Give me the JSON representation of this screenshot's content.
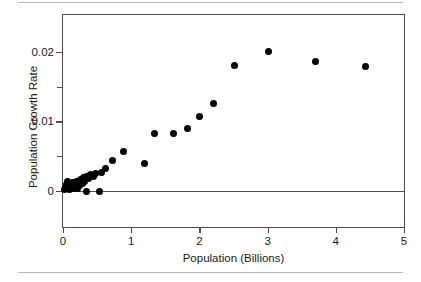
{
  "figure": {
    "rules": [
      "top-divider",
      "bottom-divider"
    ]
  },
  "chart_data": {
    "type": "scatter",
    "title": "",
    "xlabel": "Population (Billions)",
    "ylabel": "Population Growth Rate",
    "xlim": [
      0,
      5
    ],
    "ylim": [
      -0.0052,
      0.0253
    ],
    "grid": false,
    "legend": null,
    "xticks": [
      0,
      1,
      2,
      3,
      4,
      5
    ],
    "xticklabels": [
      "0",
      "1",
      "2",
      "3",
      "4",
      "5"
    ],
    "yticks": [
      0,
      0.005,
      0.01,
      0.015,
      0.02
    ],
    "yticklabels": [
      "0",
      "",
      "0.01",
      "",
      "0.02"
    ],
    "ytick_major": [
      0,
      0.01,
      0.02
    ],
    "ytick_minor": [
      0.005,
      0.015
    ],
    "zero_reference_line": 0,
    "marker": "filled-circle",
    "marker_color": "#000000",
    "marker_size_px": 7,
    "points": [
      {
        "x": 0.02,
        "y": 0.0002
      },
      {
        "x": 0.04,
        "y": 0.0005
      },
      {
        "x": 0.05,
        "y": 0.0009
      },
      {
        "x": 0.06,
        "y": 0.0013
      },
      {
        "x": 0.07,
        "y": 0.0004
      },
      {
        "x": 0.09,
        "y": 0.0011
      },
      {
        "x": 0.1,
        "y": 0.0002
      },
      {
        "x": 0.12,
        "y": 0.0007
      },
      {
        "x": 0.14,
        "y": 0.0012
      },
      {
        "x": 0.16,
        "y": 0.0003
      },
      {
        "x": 0.18,
        "y": 0.0009
      },
      {
        "x": 0.2,
        "y": 0.0014
      },
      {
        "x": 0.21,
        "y": 0.0004
      },
      {
        "x": 0.24,
        "y": 0.0008
      },
      {
        "x": 0.26,
        "y": 0.0016
      },
      {
        "x": 0.28,
        "y": 0.0011
      },
      {
        "x": 0.3,
        "y": 0.0019
      },
      {
        "x": 0.32,
        "y": 0.0013
      },
      {
        "x": 0.34,
        "y": 0.0021
      },
      {
        "x": 0.35,
        "y": -0.0001
      },
      {
        "x": 0.38,
        "y": 0.0018
      },
      {
        "x": 0.41,
        "y": 0.0023
      },
      {
        "x": 0.44,
        "y": 0.0021
      },
      {
        "x": 0.47,
        "y": 0.0025
      },
      {
        "x": 0.54,
        "y": -0.0001
      },
      {
        "x": 0.57,
        "y": 0.0026
      },
      {
        "x": 0.62,
        "y": 0.0032
      },
      {
        "x": 0.72,
        "y": 0.0044
      },
      {
        "x": 0.89,
        "y": 0.0057
      },
      {
        "x": 1.2,
        "y": 0.0039
      },
      {
        "x": 1.34,
        "y": 0.0082
      },
      {
        "x": 1.62,
        "y": 0.0082
      },
      {
        "x": 1.82,
        "y": 0.009
      },
      {
        "x": 2.0,
        "y": 0.0107
      },
      {
        "x": 2.21,
        "y": 0.0126
      },
      {
        "x": 2.52,
        "y": 0.018
      },
      {
        "x": 3.02,
        "y": 0.02
      },
      {
        "x": 3.7,
        "y": 0.0186
      },
      {
        "x": 4.44,
        "y": 0.0179
      }
    ]
  }
}
